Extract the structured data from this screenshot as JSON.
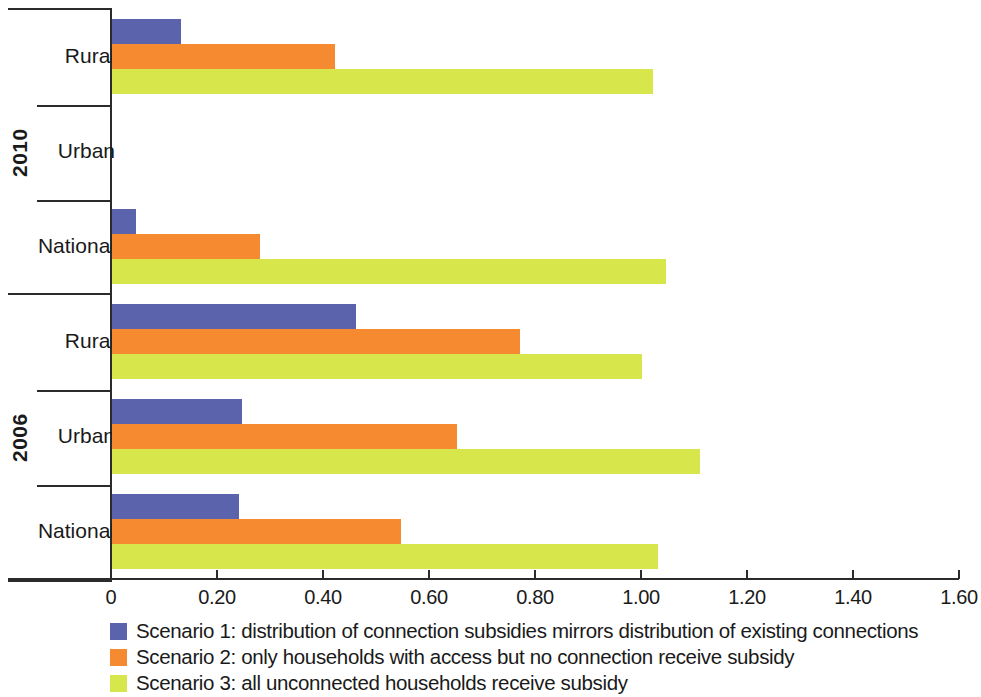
{
  "chart_data": {
    "type": "bar",
    "orientation": "horizontal",
    "title": "",
    "xlabel": "",
    "ylabel": "",
    "xlim": [
      0,
      1.6
    ],
    "xticks": [
      "0",
      "0.20",
      "0.40",
      "0.60",
      "0.80",
      "1.00",
      "1.20",
      "1.40",
      "1.60"
    ],
    "xtick_values": [
      0,
      0.2,
      0.4,
      0.6,
      0.8,
      1.0,
      1.2,
      1.4,
      1.6
    ],
    "grid": false,
    "legend_position": "bottom-left",
    "group_label_axis": "outer-y",
    "groups": [
      {
        "label": "2010",
        "categories": [
          {
            "label": "Rural",
            "values": [
              0.13,
              0.42,
              1.02
            ]
          },
          {
            "label": "Urban",
            "values": [
              null,
              null,
              null
            ]
          },
          {
            "label": "National",
            "values": [
              0.045,
              0.28,
              1.045
            ]
          }
        ]
      },
      {
        "label": "2006",
        "categories": [
          {
            "label": "Rural",
            "values": [
              0.46,
              0.77,
              1.0
            ]
          },
          {
            "label": "Urban",
            "values": [
              0.245,
              0.65,
              1.11
            ]
          },
          {
            "label": "National",
            "values": [
              0.24,
              0.545,
              1.03
            ]
          }
        ]
      }
    ],
    "series": [
      {
        "name": "Scenario 1: distribution of connection subsidies mirrors distribution of existing connections",
        "color": "#5b63ac",
        "values": [
          0.13,
          null,
          0.045,
          0.46,
          0.245,
          0.24
        ]
      },
      {
        "name": "Scenario 2: only households with access but no connection receive subsidy",
        "color": "#f58a30",
        "values": [
          0.42,
          null,
          0.28,
          0.77,
          0.65,
          0.545
        ]
      },
      {
        "name": "Scenario 3: all unconnected households receive subsidy",
        "color": "#d6e64b",
        "values": [
          1.02,
          null,
          1.045,
          1.0,
          1.11,
          1.03
        ]
      }
    ],
    "categories": [
      "2010 Rural",
      "2010 Urban",
      "2010 National",
      "2006 Rural",
      "2006 Urban",
      "2006 National"
    ]
  },
  "legend": {
    "items": [
      {
        "label": "Scenario 1: distribution of connection subsidies mirrors distribution of existing connections",
        "color": "#5b63ac"
      },
      {
        "label": "Scenario 2: only households with access but no connection receive subsidy",
        "color": "#f58a30"
      },
      {
        "label": "Scenario 3: all unconnected households receive subsidy",
        "color": "#d6e64b"
      }
    ]
  },
  "colors": {
    "scenario1": "#5b63ac",
    "scenario2": "#f58a30",
    "scenario3": "#d6e64b",
    "axis": "#2b2b2b",
    "text": "#1a1a1a",
    "background": "#ffffff"
  }
}
